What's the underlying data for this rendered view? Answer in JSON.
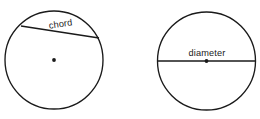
{
  "figure": {
    "background_color": "#ffffff",
    "stroke_color": "#1a1a1a",
    "width": 260,
    "height": 119,
    "shapes": [
      {
        "id": "chord-circle",
        "name": "circle-with-chord",
        "center_x": 54,
        "center_y": 60,
        "radius": 49,
        "label": "chord",
        "label_x": 61,
        "label_y": 27,
        "label_rotation": -8,
        "line_x1": 21,
        "line_y1": 26,
        "line_x2": 99,
        "line_y2": 38,
        "dot_radius": 1.9
      },
      {
        "id": "diameter-circle",
        "name": "circle-with-diameter",
        "center_x": 206.5,
        "center_y": 61,
        "radius": 49,
        "label": "diameter",
        "label_x": 207,
        "label_y": 56,
        "label_rotation": 0,
        "line_x1": 157.5,
        "line_y1": 61,
        "line_x2": 255.5,
        "line_y2": 61,
        "dot_radius": 1.9
      }
    ]
  }
}
